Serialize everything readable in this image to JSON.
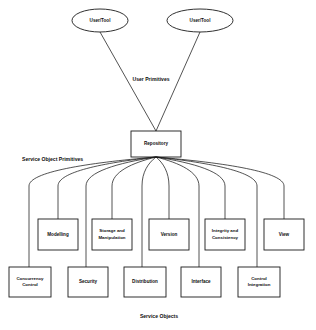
{
  "diagram": {
    "background_color": "#ffffff",
    "line_color": "#1a1a1a",
    "text_color": "#0d0d0d",
    "actors": [
      {
        "id": "user-tool-left",
        "label": "User/Tool",
        "cx": 100,
        "cy": 20.5,
        "rx": 28,
        "ry": 11.5
      },
      {
        "id": "user-tool-right",
        "label": "User/Tool",
        "cx": 200,
        "cy": 20.5,
        "rx": 33,
        "ry": 11.5
      }
    ],
    "hub": {
      "id": "repository",
      "label": "Repository",
      "x": 131,
      "y": 131,
      "width": 50,
      "height": 26
    },
    "edge_groups": [
      {
        "id": "user-primitives",
        "label": "User Primitives",
        "x": 151,
        "y": 81
      },
      {
        "id": "service-object-primitives",
        "label": "Service Object Primitives",
        "x": 22,
        "y": 161
      },
      {
        "id": "service-objects",
        "label": "Service Objects",
        "x": 159,
        "y": 318
      }
    ],
    "upper_row": [
      {
        "id": "modelling",
        "label": "Modelling",
        "lines": [
          "Modelling"
        ],
        "x": 38,
        "y": 219,
        "width": 40,
        "height": 31,
        "stem_x": 58
      },
      {
        "id": "storage-and-manipulation",
        "label": "Storage and Manipulation",
        "lines": [
          "Storage  and",
          "Manipulation"
        ],
        "x": 92,
        "y": 219,
        "width": 40,
        "height": 31,
        "stem_x": 112
      },
      {
        "id": "version",
        "label": "Version",
        "lines": [
          "Version"
        ],
        "x": 149,
        "y": 219,
        "width": 40,
        "height": 31,
        "stem_x": 169
      },
      {
        "id": "integrity-and-consistency",
        "label": "Integrity and Consistency",
        "lines": [
          "Integrity and",
          "Consistency"
        ],
        "x": 205,
        "y": 219,
        "width": 40,
        "height": 31,
        "stem_x": 225
      },
      {
        "id": "view",
        "label": "View",
        "lines": [
          "View"
        ],
        "x": 264,
        "y": 219,
        "width": 40,
        "height": 31,
        "stem_x": 284
      }
    ],
    "lower_row": [
      {
        "id": "concurrency-control",
        "label": "Concurrency Control",
        "lines": [
          "Concurrency",
          "Control"
        ],
        "x": 9,
        "y": 267,
        "width": 42,
        "height": 30,
        "stem_x": 29
      },
      {
        "id": "security",
        "label": "Security",
        "lines": [
          "Security"
        ],
        "x": 68,
        "y": 267,
        "width": 40,
        "height": 30,
        "stem_x": 86
      },
      {
        "id": "distribution",
        "label": "Distribution",
        "lines": [
          "Distribution"
        ],
        "x": 124,
        "y": 267,
        "width": 42,
        "height": 30,
        "stem_x": 142
      },
      {
        "id": "interface",
        "label": "Interface",
        "lines": [
          "Interface"
        ],
        "x": 181,
        "y": 267,
        "width": 40,
        "height": 30,
        "stem_x": 199
      },
      {
        "id": "control-integration",
        "label": "Control Integration",
        "lines": [
          "Control",
          "Integration"
        ],
        "x": 238,
        "y": 267,
        "width": 42,
        "height": 30,
        "stem_x": 257
      }
    ],
    "fan_origin": {
      "x": 156,
      "y": 157
    },
    "fan_stems": [
      {
        "id": "stem-1",
        "x": 29,
        "top_y": 186,
        "bottom_y": 267
      },
      {
        "id": "stem-2",
        "x": 58,
        "top_y": 186,
        "bottom_y": 219
      },
      {
        "id": "stem-3",
        "x": 86,
        "top_y": 186,
        "bottom_y": 267
      },
      {
        "id": "stem-4",
        "x": 112,
        "top_y": 186,
        "bottom_y": 219
      },
      {
        "id": "stem-5",
        "x": 142,
        "top_y": 186,
        "bottom_y": 267
      },
      {
        "id": "stem-6",
        "x": 169,
        "top_y": 186,
        "bottom_y": 219
      },
      {
        "id": "stem-7",
        "x": 199,
        "top_y": 186,
        "bottom_y": 267
      },
      {
        "id": "stem-8",
        "x": 225,
        "top_y": 186,
        "bottom_y": 219
      },
      {
        "id": "stem-9",
        "x": 257,
        "top_y": 186,
        "bottom_y": 267
      },
      {
        "id": "stem-10",
        "x": 284,
        "top_y": 186,
        "bottom_y": 219
      }
    ]
  },
  "chart_data": {
    "type": "diagram",
    "diagram_type": "hierarchical-block-diagram",
    "nodes": [
      "User/Tool",
      "User/Tool",
      "Repository",
      "Modelling",
      "Storage and Manipulation",
      "Version",
      "Integrity and Consistency",
      "View",
      "Concurrency Control",
      "Security",
      "Distribution",
      "Interface",
      "Control Integration"
    ],
    "edge_labels": [
      "User Primitives",
      "Service Object Primitives",
      "Service Objects"
    ],
    "edges": [
      {
        "from": "User/Tool",
        "to": "Repository",
        "label": "User Primitives"
      },
      {
        "from": "User/Tool",
        "to": "Repository",
        "label": "User Primitives"
      },
      {
        "from": "Repository",
        "to": "Modelling",
        "label": "Service Object Primitives"
      },
      {
        "from": "Repository",
        "to": "Storage and Manipulation",
        "label": "Service Object Primitives"
      },
      {
        "from": "Repository",
        "to": "Version",
        "label": "Service Object Primitives"
      },
      {
        "from": "Repository",
        "to": "Integrity and Consistency",
        "label": "Service Object Primitives"
      },
      {
        "from": "Repository",
        "to": "View",
        "label": "Service Object Primitives"
      },
      {
        "from": "Repository",
        "to": "Concurrency Control",
        "label": "Service Object Primitives"
      },
      {
        "from": "Repository",
        "to": "Security",
        "label": "Service Object Primitives"
      },
      {
        "from": "Repository",
        "to": "Distribution",
        "label": "Service Object Primitives"
      },
      {
        "from": "Repository",
        "to": "Interface",
        "label": "Service Object Primitives"
      },
      {
        "from": "Repository",
        "to": "Control Integration",
        "label": "Service Object Primitives"
      }
    ]
  }
}
